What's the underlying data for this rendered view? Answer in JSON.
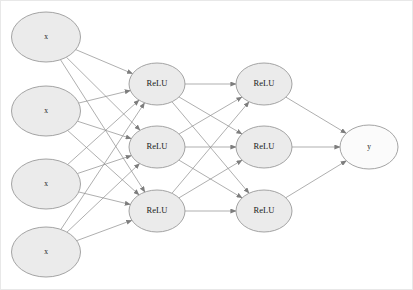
{
  "diagram": {
    "background_color": "#ffffff",
    "frame_color": "#e8e8e8",
    "node_stroke_color": "#9a9a9a",
    "edge_color": "#8c8c8c",
    "input_fill_color": "#ebebeb",
    "hidden_fill_color": "#ebebeb",
    "output_fill_color": "#fbfbfb",
    "layers": [
      {
        "name": "input-layer",
        "index": 0,
        "cx": 45,
        "rx": 34.5,
        "ry": 25,
        "fill": "#ebebeb",
        "nodes": [
          {
            "id": "input-1",
            "label": "x",
            "cy": 36
          },
          {
            "id": "input-2",
            "label": "x",
            "cy": 110
          },
          {
            "id": "input-3",
            "label": "x",
            "cy": 183
          },
          {
            "id": "input-4",
            "label": "x",
            "cy": 251
          }
        ]
      },
      {
        "name": "hidden-layer-1",
        "index": 1,
        "cx": 156,
        "rx": 28,
        "ry": 21,
        "fill": "#ebebeb",
        "nodes": [
          {
            "id": "hidden1-1",
            "label": "ReLU",
            "cy": 83
          },
          {
            "id": "hidden1-2",
            "label": "ReLU",
            "cy": 146
          },
          {
            "id": "hidden1-3",
            "label": "ReLU",
            "cy": 210
          }
        ]
      },
      {
        "name": "hidden-layer-2",
        "index": 2,
        "cx": 263,
        "rx": 28,
        "ry": 21,
        "fill": "#ebebeb",
        "nodes": [
          {
            "id": "hidden2-1",
            "label": "ReLU",
            "cy": 83
          },
          {
            "id": "hidden2-2",
            "label": "ReLU",
            "cy": 146
          },
          {
            "id": "hidden2-3",
            "label": "ReLU",
            "cy": 210
          }
        ]
      },
      {
        "name": "output-layer",
        "index": 3,
        "cx": 368,
        "rx": 29,
        "ry": 22,
        "fill": "#fbfbfb",
        "nodes": [
          {
            "id": "output-1",
            "label": "y",
            "cy": 146
          }
        ]
      }
    ],
    "connections": [
      {
        "from": "input-1",
        "to": "hidden1-1"
      },
      {
        "from": "input-1",
        "to": "hidden1-2"
      },
      {
        "from": "input-1",
        "to": "hidden1-3"
      },
      {
        "from": "input-2",
        "to": "hidden1-1"
      },
      {
        "from": "input-2",
        "to": "hidden1-2"
      },
      {
        "from": "input-2",
        "to": "hidden1-3"
      },
      {
        "from": "input-3",
        "to": "hidden1-1"
      },
      {
        "from": "input-3",
        "to": "hidden1-2"
      },
      {
        "from": "input-3",
        "to": "hidden1-3"
      },
      {
        "from": "input-4",
        "to": "hidden1-1"
      },
      {
        "from": "input-4",
        "to": "hidden1-2"
      },
      {
        "from": "input-4",
        "to": "hidden1-3"
      },
      {
        "from": "hidden1-1",
        "to": "hidden2-1"
      },
      {
        "from": "hidden1-1",
        "to": "hidden2-2"
      },
      {
        "from": "hidden1-1",
        "to": "hidden2-3"
      },
      {
        "from": "hidden1-2",
        "to": "hidden2-1"
      },
      {
        "from": "hidden1-2",
        "to": "hidden2-2"
      },
      {
        "from": "hidden1-2",
        "to": "hidden2-3"
      },
      {
        "from": "hidden1-3",
        "to": "hidden2-1"
      },
      {
        "from": "hidden1-3",
        "to": "hidden2-2"
      },
      {
        "from": "hidden1-3",
        "to": "hidden2-3"
      },
      {
        "from": "hidden2-1",
        "to": "output-1"
      },
      {
        "from": "hidden2-2",
        "to": "output-1"
      },
      {
        "from": "hidden2-3",
        "to": "output-1"
      }
    ]
  }
}
